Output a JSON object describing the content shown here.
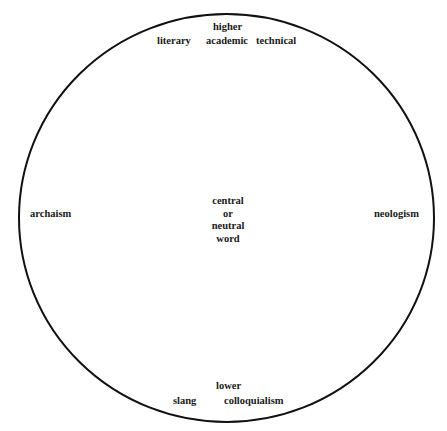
{
  "diagram": {
    "type": "circle-vocabulary-layers",
    "colors": {
      "stroke": "#111111",
      "text": "#1a1a1a",
      "background": "#ffffff"
    },
    "top": {
      "heading": "higher",
      "items": [
        "literary",
        "academic",
        "technical"
      ]
    },
    "bottom": {
      "heading": "lower",
      "items": [
        "slang",
        "colloquialism"
      ]
    },
    "left": "archaism",
    "right": "neologism",
    "center": [
      "central",
      "or",
      "neutral",
      "word"
    ]
  }
}
